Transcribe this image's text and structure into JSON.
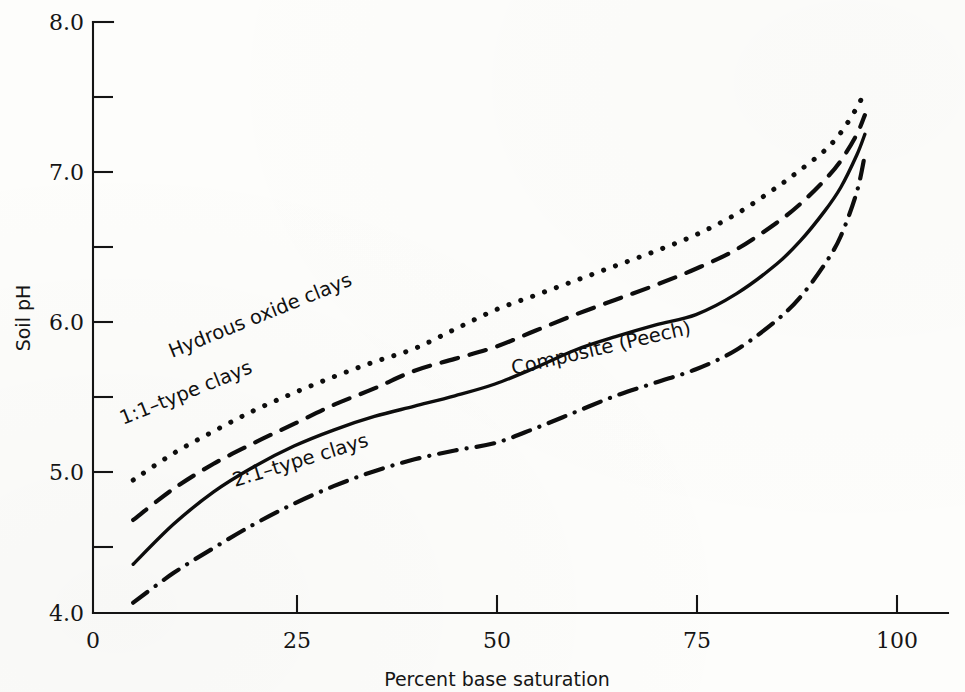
{
  "figure": {
    "title": "",
    "background_color": "#fdfdfb",
    "ink_color": "#0d0d0d"
  },
  "axes": {
    "y_title": "Soil pH",
    "x_title": "Percent base saturation",
    "y_ticklabels": [
      "8.0",
      "7.0",
      "6.0",
      "5.0",
      "4.0"
    ],
    "x_ticklabels": [
      "0",
      "25",
      "50",
      "75",
      "100"
    ]
  },
  "curve_labels": {
    "hydrous": "Hydrous oxide clays",
    "one_one": "1:1–type clays",
    "composite": "Composite (Peech)",
    "two_one": "2:1–type clays"
  },
  "chart_data": {
    "type": "line",
    "title": "",
    "xlabel": "Percent base saturation",
    "ylabel": "Soil pH",
    "xlim": [
      0,
      100
    ],
    "ylim": [
      4.0,
      8.0
    ],
    "xticks": [
      0,
      25,
      50,
      75,
      100
    ],
    "yticks": [
      4.0,
      5.0,
      6.0,
      7.0,
      8.0
    ],
    "yminorticks": [
      4.5,
      5.5,
      6.5,
      7.5
    ],
    "grid": false,
    "legend": "inline-labels-on-curves",
    "series": [
      {
        "name": "Hydrous oxide clays",
        "style": "dotted",
        "x": [
          5,
          10,
          15,
          20,
          25,
          30,
          35,
          40,
          45,
          50,
          55,
          60,
          65,
          70,
          75,
          80,
          85,
          88,
          91,
          93,
          95,
          96
        ],
        "y": [
          4.9,
          5.08,
          5.23,
          5.37,
          5.49,
          5.6,
          5.7,
          5.79,
          5.92,
          6.05,
          6.15,
          6.25,
          6.35,
          6.45,
          6.56,
          6.7,
          6.88,
          7.0,
          7.13,
          7.25,
          7.42,
          7.53
        ]
      },
      {
        "name": "1:1–type clays",
        "style": "dashed",
        "x": [
          5,
          10,
          15,
          20,
          25,
          30,
          35,
          40,
          45,
          50,
          55,
          60,
          65,
          70,
          75,
          80,
          85,
          88,
          91,
          93,
          95,
          96
        ],
        "y": [
          4.63,
          4.84,
          5.01,
          5.15,
          5.28,
          5.41,
          5.52,
          5.64,
          5.72,
          5.8,
          5.91,
          6.02,
          6.12,
          6.22,
          6.33,
          6.46,
          6.64,
          6.77,
          6.93,
          7.06,
          7.24,
          7.37
        ]
      },
      {
        "name": "Composite (Peech)",
        "style": "solid",
        "x": [
          5,
          10,
          15,
          20,
          25,
          30,
          35,
          40,
          45,
          50,
          55,
          60,
          65,
          70,
          75,
          80,
          85,
          88,
          91,
          93,
          95,
          96
        ],
        "y": [
          4.33,
          4.6,
          4.82,
          4.99,
          5.13,
          5.24,
          5.33,
          5.4,
          5.47,
          5.55,
          5.66,
          5.78,
          5.87,
          5.95,
          6.02,
          6.16,
          6.36,
          6.52,
          6.72,
          6.88,
          7.1,
          7.24
        ]
      },
      {
        "name": "2:1–type clays",
        "style": "dash-dot",
        "x": [
          5,
          10,
          15,
          20,
          25,
          30,
          35,
          40,
          45,
          50,
          55,
          60,
          65,
          70,
          75,
          80,
          85,
          88,
          91,
          93,
          95,
          96
        ],
        "y": [
          4.07,
          4.27,
          4.44,
          4.6,
          4.74,
          4.86,
          4.96,
          5.04,
          5.1,
          5.15,
          5.25,
          5.36,
          5.47,
          5.56,
          5.65,
          5.78,
          5.98,
          6.14,
          6.36,
          6.55,
          6.85,
          7.1
        ]
      }
    ]
  }
}
